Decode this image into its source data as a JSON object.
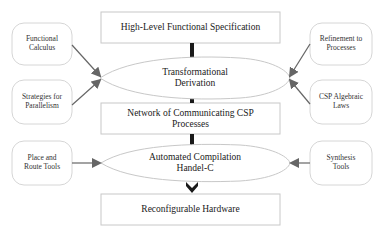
{
  "diagram": {
    "main_flow": {
      "spec_box": {
        "label": "High-Level Functional Specification"
      },
      "derivation_ellipse": {
        "line1": "Transformational",
        "line2": "Derivation"
      },
      "network_box": {
        "line1": "Network of Communicating CSP",
        "line2": "Processes"
      },
      "compilation_ellipse": {
        "line1": "Automated Compilation",
        "line2": "Handel-C"
      },
      "hardware_box": {
        "label": "Reconfigurable Hardware"
      }
    },
    "left_inputs": [
      {
        "line1": "Functional",
        "line2": "Calculus",
        "target": "derivation_ellipse"
      },
      {
        "line1": "Strategies for",
        "line2": "Parallelism",
        "target": "derivation_ellipse"
      },
      {
        "line1": "Place and",
        "line2": "Route Tools",
        "target": "compilation_ellipse"
      }
    ],
    "right_inputs": [
      {
        "line1": "Refinement to",
        "line2": "Processes",
        "target": "derivation_ellipse"
      },
      {
        "line1": "CSP Algebraic",
        "line2": "Laws",
        "target": "derivation_ellipse"
      },
      {
        "line1": "Synthesis",
        "line2": "Tools",
        "target": "compilation_ellipse"
      }
    ],
    "colors": {
      "box_border": "#c8c8c8",
      "arrow": "#666666",
      "connector": "#1a1a1a"
    }
  }
}
